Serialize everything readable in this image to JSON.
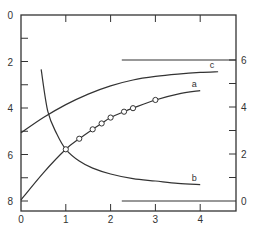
{
  "chart_data": {
    "type": "line",
    "title": "",
    "xlabel": "",
    "ylabel_left": "",
    "ylabel_right": "",
    "x_ticks": [
      0,
      1,
      2,
      3,
      4
    ],
    "y_left_ticks": [
      0,
      2,
      4,
      6,
      8
    ],
    "y_left_inverted": true,
    "y_right_ticks": [
      0,
      2,
      4,
      6
    ],
    "xlim": [
      0,
      4.8
    ],
    "ylim_left": [
      0,
      8
    ],
    "ylim_right": [
      0,
      6
    ],
    "reference_lines": [
      {
        "axis": "right",
        "y": 6,
        "x_start": 2.25,
        "x_end": 4.8
      },
      {
        "axis": "right",
        "y": 0,
        "x_start": 2.25,
        "x_end": 4.8
      }
    ],
    "series": [
      {
        "name": "a",
        "axis": "right",
        "markers": "open-circle",
        "x": [
          0.0,
          0.5,
          1.0,
          1.3,
          1.6,
          1.8,
          2.0,
          2.3,
          2.5,
          3.0,
          3.5,
          4.0
        ],
        "values": [
          0.05,
          1.2,
          2.2,
          2.65,
          3.05,
          3.3,
          3.55,
          3.8,
          3.95,
          4.3,
          4.55,
          4.7
        ],
        "marker_x": [
          1.0,
          1.3,
          1.6,
          1.8,
          2.0,
          2.3,
          2.5,
          3.0
        ]
      },
      {
        "name": "c",
        "axis": "right",
        "markers": "none",
        "x": [
          0.0,
          0.5,
          1.0,
          1.5,
          2.0,
          2.5,
          3.0,
          3.5,
          4.0,
          4.4
        ],
        "values": [
          2.9,
          3.55,
          4.1,
          4.55,
          4.9,
          5.15,
          5.3,
          5.4,
          5.47,
          5.5
        ]
      },
      {
        "name": "b",
        "axis": "right",
        "markers": "none",
        "x": [
          0.45,
          0.6,
          0.8,
          1.0,
          1.3,
          1.6,
          2.0,
          2.5,
          3.0,
          3.5,
          4.0
        ],
        "values": [
          5.6,
          3.8,
          2.85,
          2.2,
          1.7,
          1.4,
          1.15,
          0.95,
          0.85,
          0.75,
          0.7
        ]
      }
    ]
  },
  "labels": {
    "x_ticks": [
      "0",
      "1",
      "2",
      "3",
      "4"
    ],
    "y_left_ticks": [
      "0",
      "2",
      "4",
      "6",
      "8"
    ],
    "y_right_ticks": [
      "0",
      "2",
      "4",
      "6"
    ],
    "curve_a": "a",
    "curve_b": "b",
    "curve_c": "c"
  }
}
